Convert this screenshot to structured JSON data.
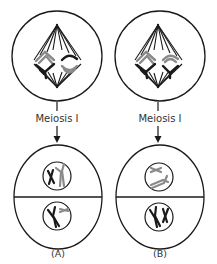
{
  "diagram": {
    "panels": [
      {
        "id": "A",
        "stage_label": "Meiosis I",
        "panel_label": "(A)",
        "top_cell": "metaphase I cell with spindle and two homologous pairs",
        "bottom_cells": [
          "daughter cell with nucleus (black X + grey bent chromosome)",
          "daughter cell with nucleus (black bent chromosome + grey small chromosome)"
        ]
      },
      {
        "id": "B",
        "stage_label": "Meiosis I",
        "panel_label": "(B)",
        "top_cell": "metaphase I cell with spindle and two homologous pairs",
        "bottom_cells": [
          "daughter cell with nucleus (two grey chromosomes)",
          "daughter cell with nucleus (two black chromosomes)"
        ]
      }
    ],
    "colors": {
      "stroke": "#1a1a1a",
      "grey_chromosome": "#8a8a8a",
      "text": "#333333",
      "background": "#ffffff"
    }
  }
}
